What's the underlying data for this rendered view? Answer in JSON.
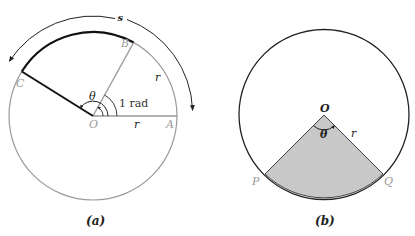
{
  "figure_a": {
    "caption": "(a)",
    "labels": {
      "arc_length": "s",
      "point_A": "A",
      "point_B": "B",
      "point_C": "C",
      "center": "O",
      "radius_1": "r",
      "radius_2": "r",
      "angle": "θ",
      "one_radian": "1 rad"
    }
  },
  "figure_b": {
    "caption": "(b)",
    "labels": {
      "center": "O",
      "point_P": "P",
      "point_Q": "Q",
      "radius": "r",
      "angle": "θ"
    },
    "sector_fill": "#c8c8c8"
  },
  "colors": {
    "circle_a": "#9a9a9a",
    "thick_arc": "#111111",
    "circle_b": "#222222"
  }
}
